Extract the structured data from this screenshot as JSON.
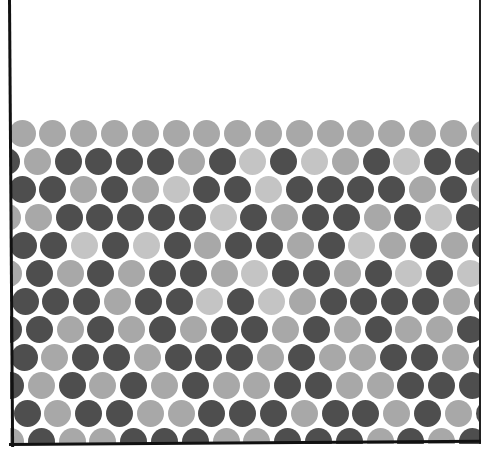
{
  "figure": {
    "colors": {
      "L": "#a8a8a8",
      "VL": "#c4c4c4",
      "D": "#4e4e4e",
      "background": "#ffffff",
      "border": "#111111"
    },
    "grid": {
      "row_top_y": 133,
      "row_pitch": 28,
      "col_pitch": 30.8,
      "odd_row_start_x": 22,
      "even_row_start_x": 6.5,
      "diameter": 27,
      "per_row_x_shift": [
        0,
        0,
        0,
        1,
        1,
        2,
        3,
        2,
        2,
        4,
        5,
        4
      ]
    },
    "rows": [
      [
        "L",
        "L",
        "L",
        "L",
        "L",
        "L",
        "L",
        "L",
        "L",
        "L",
        "L",
        "L",
        "L",
        "L",
        "L",
        "L"
      ],
      [
        "D",
        "L",
        "D",
        "D",
        "D",
        "D",
        "L",
        "D",
        "VL",
        "D",
        "VL",
        "L",
        "D",
        "VL",
        "D",
        "D"
      ],
      [
        "D",
        "D",
        "L",
        "D",
        "L",
        "VL",
        "D",
        "D",
        "VL",
        "D",
        "D",
        "D",
        "D",
        "L",
        "D",
        "L"
      ],
      [
        "L",
        "L",
        "D",
        "D",
        "D",
        "D",
        "D",
        "VL",
        "D",
        "L",
        "D",
        "D",
        "L",
        "D",
        "VL",
        "D"
      ],
      [
        "D",
        "D",
        "VL",
        "D",
        "VL",
        "D",
        "L",
        "D",
        "D",
        "L",
        "D",
        "VL",
        "L",
        "D",
        "L",
        "D"
      ],
      [
        "L",
        "D",
        "L",
        "D",
        "L",
        "D",
        "D",
        "L",
        "VL",
        "D",
        "D",
        "L",
        "D",
        "VL",
        "D",
        "VL"
      ],
      [
        "D",
        "D",
        "D",
        "L",
        "D",
        "D",
        "VL",
        "D",
        "VL",
        "L",
        "D",
        "D",
        "D",
        "D",
        "L",
        "D"
      ],
      [
        "D",
        "D",
        "L",
        "D",
        "L",
        "D",
        "L",
        "D",
        "D",
        "L",
        "D",
        "L",
        "D",
        "L",
        "L",
        "D"
      ],
      [
        "D",
        "L",
        "D",
        "D",
        "L",
        "D",
        "D",
        "D",
        "L",
        "D",
        "L",
        "L",
        "D",
        "D",
        "L",
        "D"
      ],
      [
        "D",
        "L",
        "D",
        "L",
        "D",
        "L",
        "D",
        "L",
        "L",
        "D",
        "D",
        "L",
        "L",
        "D",
        "D",
        "D"
      ],
      [
        "D",
        "L",
        "D",
        "D",
        "L",
        "L",
        "D",
        "D",
        "D",
        "L",
        "D",
        "D",
        "L",
        "D",
        "L",
        "D"
      ],
      [
        "L",
        "D",
        "L",
        "L",
        "D",
        "D",
        "D",
        "L",
        "L",
        "D",
        "D",
        "D",
        "L",
        "D",
        "L",
        "D"
      ]
    ]
  }
}
